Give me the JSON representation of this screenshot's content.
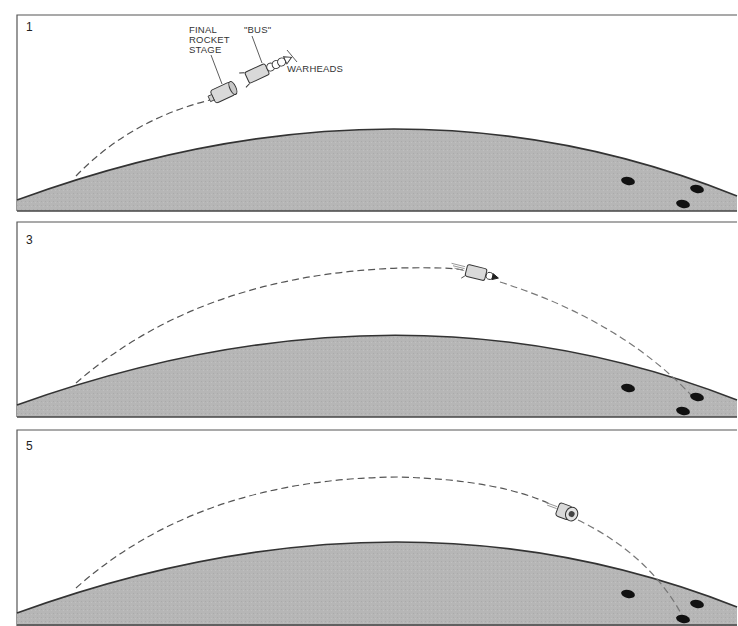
{
  "figure": {
    "type": "sequence-diagram",
    "colors": {
      "earth_fill": "#b4b4b4",
      "earth_outline": "#333333",
      "trajectory": "#555555",
      "panel_border": "#555555",
      "target": "#111111",
      "vehicle_fill": "#d9d9d9"
    }
  },
  "panels": [
    {
      "number": "1",
      "labels": {
        "final_rocket_stage": [
          "FINAL",
          "ROCKET",
          "STAGE"
        ],
        "bus": "\"BUS\"",
        "warheads": "WARHEADS"
      },
      "targets": 3
    },
    {
      "number": "3",
      "targets": 3
    },
    {
      "number": "5",
      "targets": 3
    }
  ]
}
